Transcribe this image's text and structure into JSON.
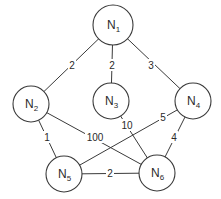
{
  "diagram": {
    "type": "weighted-undirected-graph",
    "nodes": [
      {
        "id": "N1",
        "base": "N",
        "sub": "1",
        "x": 113,
        "y": 25,
        "r": 20
      },
      {
        "id": "N2",
        "base": "N",
        "sub": "2",
        "x": 31,
        "y": 104,
        "r": 18
      },
      {
        "id": "N3",
        "base": "N",
        "sub": "3",
        "x": 111,
        "y": 101,
        "r": 18
      },
      {
        "id": "N4",
        "base": "N",
        "sub": "4",
        "x": 193,
        "y": 101,
        "r": 18
      },
      {
        "id": "N5",
        "base": "N",
        "sub": "5",
        "x": 64,
        "y": 174,
        "r": 18
      },
      {
        "id": "N6",
        "base": "N",
        "sub": "6",
        "x": 157,
        "y": 173,
        "r": 18
      }
    ],
    "edges": [
      {
        "from": "N1",
        "to": "N2",
        "weight": "2",
        "lx": 72,
        "ly": 65
      },
      {
        "from": "N1",
        "to": "N3",
        "weight": "2",
        "lx": 112,
        "ly": 65
      },
      {
        "from": "N1",
        "to": "N4",
        "weight": "3",
        "lx": 151,
        "ly": 65
      },
      {
        "from": "N2",
        "to": "N5",
        "weight": "1",
        "lx": 47,
        "ly": 137
      },
      {
        "from": "N2",
        "to": "N6",
        "weight": "100",
        "lx": 95,
        "ly": 137
      },
      {
        "from": "N3",
        "to": "N6",
        "weight": "10",
        "lx": 127,
        "ly": 125
      },
      {
        "from": "N4",
        "to": "N5",
        "weight": "5",
        "lx": 163,
        "ly": 117
      },
      {
        "from": "N4",
        "to": "N6",
        "weight": "4",
        "lx": 174,
        "ly": 137
      },
      {
        "from": "N5",
        "to": "N6",
        "weight": "2",
        "lx": 110,
        "ly": 173
      }
    ]
  }
}
